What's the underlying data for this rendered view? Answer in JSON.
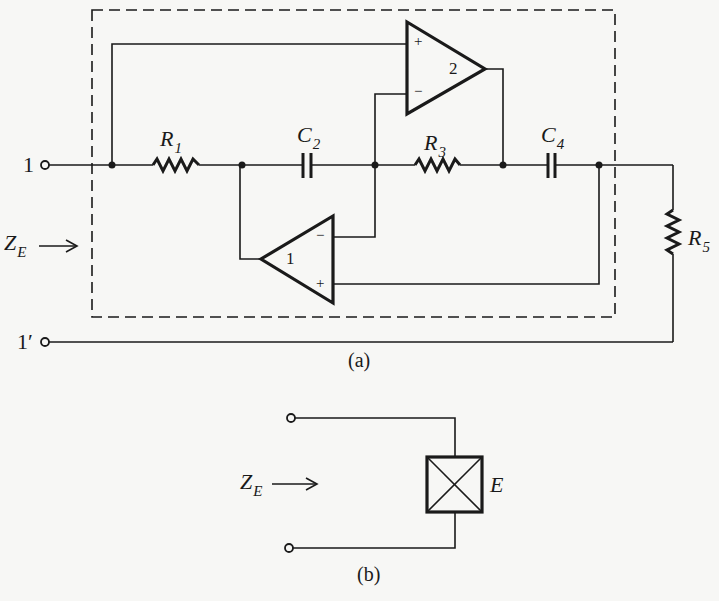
{
  "figure_a": {
    "caption": "(a)",
    "terminal_top": {
      "name": "1",
      "prime": ""
    },
    "terminal_bottom": {
      "name": "1",
      "prime": "′"
    },
    "input_impedance": {
      "symbol": "Z",
      "subscript": "E"
    },
    "components": {
      "R1": {
        "symbol": "R",
        "subscript": "1",
        "type": "resistor"
      },
      "C2": {
        "symbol": "C",
        "subscript": "2",
        "type": "capacitor"
      },
      "R3": {
        "symbol": "R",
        "subscript": "3",
        "type": "resistor"
      },
      "C4": {
        "symbol": "C",
        "subscript": "4",
        "type": "capacitor"
      },
      "R5": {
        "symbol": "R",
        "subscript": "5",
        "type": "resistor"
      }
    },
    "opamps": {
      "opamp1": {
        "label": "1",
        "plus": "+",
        "minus": "−"
      },
      "opamp2": {
        "label": "2",
        "plus": "+",
        "minus": "−"
      }
    }
  },
  "figure_b": {
    "caption": "(b)",
    "input_impedance": {
      "symbol": "Z",
      "subscript": "E"
    },
    "element": {
      "symbol": "E"
    }
  },
  "colors": {
    "ink": "#1a1a1a",
    "paper": "#f7f7f5"
  }
}
